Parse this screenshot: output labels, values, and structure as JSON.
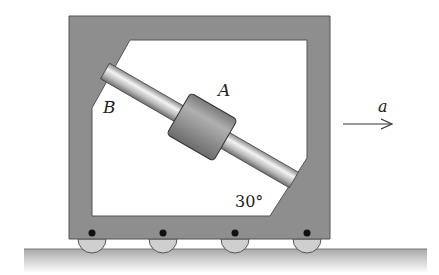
{
  "diagram": {
    "labels": {
      "collar": "A",
      "rod_end": "B",
      "acceleration": "a",
      "angle": "30°"
    },
    "colors": {
      "frame": "#8a8a8a",
      "frame_edge": "#555555",
      "rod": "#c8c8c8",
      "collar": "#9a9a9a",
      "wheel": "#c9c9c9",
      "ground": "#b5b5b5"
    },
    "wheel_count": 4
  }
}
